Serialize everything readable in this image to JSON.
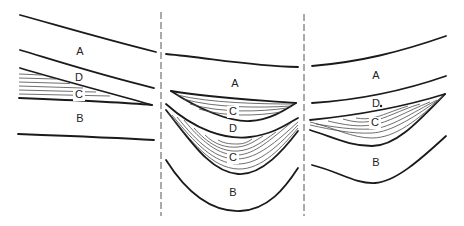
{
  "figure": {
    "type": "geologic-cross-section-diagram",
    "panels": [
      {
        "id": "left",
        "labels": [
          {
            "text": "A",
            "x": 80,
            "y": 52
          },
          {
            "text": "D",
            "x": 79,
            "y": 78
          },
          {
            "text": "C",
            "x": 79,
            "y": 95
          },
          {
            "text": "B",
            "x": 80,
            "y": 119
          }
        ]
      },
      {
        "id": "middle",
        "labels": [
          {
            "text": "A",
            "x": 235,
            "y": 84
          },
          {
            "text": "C",
            "x": 233,
            "y": 112
          },
          {
            "text": "D",
            "x": 233,
            "y": 129
          },
          {
            "text": "C",
            "x": 233,
            "y": 158
          },
          {
            "text": "B",
            "x": 233,
            "y": 193
          }
        ]
      },
      {
        "id": "right",
        "labels": [
          {
            "text": "A",
            "x": 376,
            "y": 76
          },
          {
            "text": "D",
            "x": 376,
            "y": 104
          },
          {
            "text": "C",
            "x": 375,
            "y": 123
          },
          {
            "text": "B",
            "x": 376,
            "y": 163
          }
        ]
      }
    ],
    "dividers": [
      {
        "x": 161,
        "y1": 12,
        "y2": 216
      },
      {
        "x": 304,
        "y1": 14,
        "y2": 216
      }
    ],
    "stroke_color": "#1a1a1a",
    "background": "#ffffff"
  }
}
